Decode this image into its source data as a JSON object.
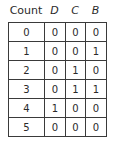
{
  "table": {
    "headers": [
      "Count",
      "D",
      "C",
      "B"
    ],
    "rows": [
      [
        "0",
        "0",
        "0",
        "0"
      ],
      [
        "1",
        "0",
        "0",
        "1"
      ],
      [
        "2",
        "0",
        "1",
        "0"
      ],
      [
        "3",
        "0",
        "1",
        "1"
      ],
      [
        "4",
        "1",
        "0",
        "0"
      ],
      [
        "5",
        "0",
        "0",
        "0"
      ]
    ]
  }
}
